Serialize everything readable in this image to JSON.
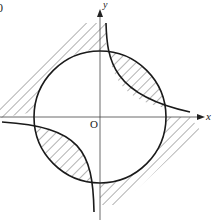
{
  "figure": {
    "corner_label": "0",
    "axes": {
      "x_label": "x",
      "y_label": "y",
      "origin_label": "O"
    },
    "colors": {
      "stroke": "#1a1a1a",
      "hatch": "#555555",
      "axis": "#444444"
    }
  }
}
